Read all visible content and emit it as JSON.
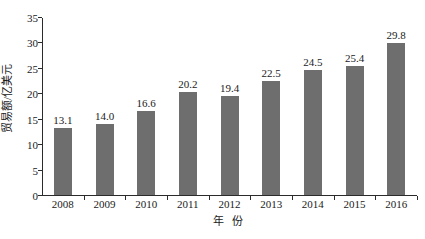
{
  "chart_data": {
    "type": "bar",
    "title": "",
    "subtitle": "",
    "xlabel": "年 份",
    "ylabel": "贸易额/亿美元",
    "categories": [
      "2008",
      "2009",
      "2010",
      "2011",
      "2012",
      "2013",
      "2014",
      "2015",
      "2016"
    ],
    "values": [
      13.1,
      14.0,
      16.6,
      20.2,
      19.4,
      22.5,
      24.5,
      25.4,
      29.8
    ],
    "value_labels": [
      "13.1",
      "14.0",
      "16.6",
      "20.2",
      "19.4",
      "22.5",
      "24.5",
      "25.4",
      "29.8"
    ],
    "ylim": [
      0,
      35
    ],
    "ytick_values": [
      0,
      5,
      10,
      15,
      20,
      25,
      30,
      35
    ],
    "ytick_labels": [
      "0",
      "5",
      "10",
      "15",
      "20",
      "25",
      "30",
      "35"
    ],
    "grid": false,
    "legend": null,
    "legend_position": "none",
    "bar_color": "#6e6e6e",
    "axis_color": "#2b2b2b",
    "text_color": "#1a1a1a",
    "background_color": "#ffffff",
    "annotations": []
  }
}
